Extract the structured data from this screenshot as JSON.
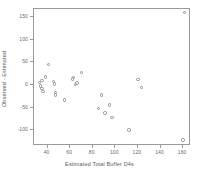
{
  "chart_data": {
    "type": "scatter",
    "title": "",
    "xlabel": "Estimated Total Buffer D4s",
    "ylabel": "Observed - Estimated",
    "xlim": [
      28,
      167
    ],
    "ylim": [
      -135,
      168
    ],
    "grid": false,
    "legend": null,
    "marker": "open-circle",
    "marker_color": "#8e8e8e",
    "xticks": [
      40,
      60,
      80,
      100,
      120,
      140,
      160
    ],
    "yticks": [
      -100,
      -50,
      0,
      50,
      100,
      150
    ],
    "xtick_labels": [
      "40",
      "60",
      "80",
      "100",
      "120",
      "140",
      "160"
    ],
    "ytick_labels": [
      "-100",
      "-50",
      "0",
      "50",
      "100",
      "150"
    ],
    "points": [
      {
        "x": 33,
        "y": 5
      },
      {
        "x": 34,
        "y": -2
      },
      {
        "x": 35,
        "y": 10
      },
      {
        "x": 35,
        "y": -8
      },
      {
        "x": 36,
        "y": -14
      },
      {
        "x": 38,
        "y": 18
      },
      {
        "x": 41,
        "y": 45
      },
      {
        "x": 45,
        "y": 8
      },
      {
        "x": 46,
        "y": 2
      },
      {
        "x": 47,
        "y": -16
      },
      {
        "x": 47,
        "y": -22
      },
      {
        "x": 55,
        "y": -33
      },
      {
        "x": 62,
        "y": 13
      },
      {
        "x": 63,
        "y": 16
      },
      {
        "x": 65,
        "y": 1
      },
      {
        "x": 66,
        "y": 4
      },
      {
        "x": 70,
        "y": 27
      },
      {
        "x": 85,
        "y": -52
      },
      {
        "x": 88,
        "y": -22
      },
      {
        "x": 91,
        "y": -62
      },
      {
        "x": 95,
        "y": -44
      },
      {
        "x": 97,
        "y": -72
      },
      {
        "x": 112,
        "y": -100
      },
      {
        "x": 120,
        "y": 12
      },
      {
        "x": 123,
        "y": -5
      },
      {
        "x": 161,
        "y": 160
      },
      {
        "x": 160,
        "y": -122
      }
    ]
  }
}
